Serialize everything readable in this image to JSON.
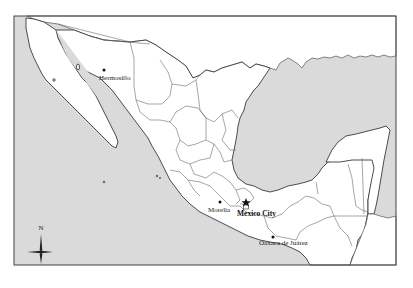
{
  "map": {
    "region": "Mexico",
    "colors": {
      "water": "#dadada",
      "land": "#ffffff",
      "border": "#555555"
    },
    "cities": [
      {
        "name": "Hermosillo",
        "type": "city"
      },
      {
        "name": "Morelia",
        "type": "city"
      },
      {
        "name": "Mexico City",
        "type": "capital"
      },
      {
        "name": "Oaxaca de Juárez",
        "type": "city"
      }
    ],
    "compass": {
      "north_label": "N"
    }
  }
}
